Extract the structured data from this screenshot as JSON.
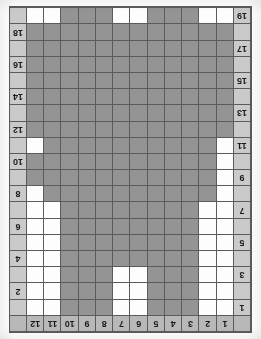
{
  "chart_data": {
    "type": "heatmap",
    "title": "",
    "subtitle": "",
    "xlabel": "",
    "ylabel": "",
    "orientation": "rotated-180",
    "columns": 12,
    "rows": 19,
    "legend": [],
    "annotations": [],
    "grid": true,
    "colors": {
      "filled": "#949494",
      "empty": "#fdfdfd",
      "gridline": "#5b5b5b",
      "header_background": "#b8b8b8",
      "rownum_background": "#cacaca",
      "page_background": "#ffffff"
    },
    "column_headers": [
      "1",
      "2",
      "3",
      "4",
      "5",
      "6",
      "7",
      "8",
      "9",
      "10",
      "11",
      "12"
    ],
    "row_labels_left": [
      "1",
      "",
      "3",
      "",
      "5",
      "",
      "7",
      "",
      "9",
      "",
      "11",
      "",
      "13",
      "",
      "15",
      "",
      "17",
      "",
      "19"
    ],
    "row_labels_right": [
      "",
      "2",
      "",
      "4",
      "",
      "6",
      "",
      "8",
      "",
      "10",
      "",
      "12",
      "",
      "14",
      "",
      "16",
      "",
      "18",
      ""
    ],
    "row_numbers_odd": [
      "1",
      "3",
      "5",
      "7",
      "9",
      "11",
      "13",
      "15",
      "17",
      "19"
    ],
    "row_numbers_even": [
      "2",
      "4",
      "6",
      "8",
      "10",
      "12",
      "14",
      "16",
      "18"
    ],
    "cells": [
      [
        0,
        0,
        1,
        1,
        1,
        0,
        0,
        1,
        1,
        1,
        0,
        0
      ],
      [
        0,
        0,
        1,
        1,
        1,
        0,
        0,
        1,
        1,
        1,
        0,
        0
      ],
      [
        0,
        0,
        1,
        1,
        1,
        0,
        0,
        1,
        1,
        1,
        0,
        0
      ],
      [
        0,
        0,
        1,
        1,
        1,
        1,
        1,
        1,
        1,
        1,
        0,
        0
      ],
      [
        0,
        0,
        1,
        1,
        1,
        1,
        1,
        1,
        1,
        1,
        0,
        0
      ],
      [
        0,
        0,
        1,
        1,
        1,
        1,
        1,
        1,
        1,
        1,
        0,
        0
      ],
      [
        0,
        0,
        1,
        1,
        1,
        1,
        1,
        1,
        1,
        1,
        0,
        0
      ],
      [
        0,
        1,
        1,
        1,
        1,
        1,
        1,
        1,
        1,
        1,
        1,
        0
      ],
      [
        0,
        1,
        1,
        1,
        1,
        1,
        1,
        1,
        1,
        1,
        1,
        1
      ],
      [
        0,
        1,
        1,
        1,
        1,
        1,
        1,
        1,
        1,
        1,
        1,
        1
      ],
      [
        0,
        1,
        1,
        1,
        1,
        1,
        1,
        1,
        1,
        1,
        1,
        0
      ],
      [
        1,
        1,
        1,
        1,
        1,
        1,
        1,
        1,
        1,
        1,
        1,
        1
      ],
      [
        1,
        1,
        1,
        1,
        1,
        1,
        1,
        1,
        1,
        1,
        1,
        1
      ],
      [
        1,
        1,
        1,
        1,
        1,
        1,
        1,
        1,
        1,
        1,
        1,
        1
      ],
      [
        1,
        1,
        1,
        1,
        1,
        1,
        1,
        1,
        1,
        1,
        1,
        1
      ],
      [
        1,
        1,
        1,
        1,
        1,
        1,
        1,
        1,
        1,
        1,
        1,
        1
      ],
      [
        1,
        1,
        1,
        1,
        1,
        1,
        1,
        1,
        1,
        1,
        1,
        1
      ],
      [
        1,
        1,
        1,
        1,
        1,
        1,
        1,
        1,
        1,
        1,
        1,
        1
      ],
      [
        0,
        0,
        1,
        1,
        1,
        0,
        0,
        1,
        1,
        1,
        0,
        0
      ]
    ]
  }
}
